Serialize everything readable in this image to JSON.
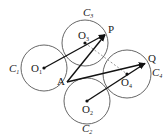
{
  "diagram": {
    "type": "geometry",
    "circles": [
      {
        "name": "C1",
        "label": "C",
        "sub": "1",
        "center": "O1",
        "cx": 44,
        "cy": 68,
        "r": 23
      },
      {
        "name": "C3",
        "label": "C",
        "sub": "3",
        "center": "O3",
        "cx": 85,
        "cy": 43,
        "r": 23
      },
      {
        "name": "C4",
        "label": "C",
        "sub": "4",
        "center": "O4",
        "cx": 127,
        "cy": 74,
        "r": 24
      },
      {
        "name": "C2",
        "label": "C",
        "sub": "2",
        "center": "O2",
        "cx": 87,
        "cy": 101,
        "r": 23
      }
    ],
    "points": {
      "O1": {
        "label": "O",
        "sub": "1",
        "x": 44,
        "y": 68
      },
      "O2": {
        "label": "O",
        "sub": "2",
        "x": 87,
        "y": 101
      },
      "O3": {
        "label": "O",
        "sub": "3",
        "x": 85,
        "y": 43
      },
      "O4": {
        "label": "O",
        "sub": "4",
        "x": 127,
        "y": 74
      },
      "A": {
        "label": "A",
        "x": 67,
        "y": 82
      },
      "P": {
        "label": "P",
        "x": 106,
        "y": 34
      },
      "Q": {
        "label": "Q",
        "x": 146,
        "y": 63
      }
    },
    "arrows": [
      {
        "from": "A",
        "to": "P"
      },
      {
        "from": "A",
        "to": "Q"
      },
      {
        "from": "O1",
        "to": "P"
      },
      {
        "from": "O2",
        "to": "Q"
      }
    ],
    "dashed": [
      {
        "from": "O3",
        "to": "O4"
      }
    ],
    "labels": {
      "A": "A",
      "P": "P",
      "Q": "Q",
      "O": "O",
      "C": "C",
      "s1": "1",
      "s2": "2",
      "s3": "3",
      "s4": "4"
    }
  }
}
